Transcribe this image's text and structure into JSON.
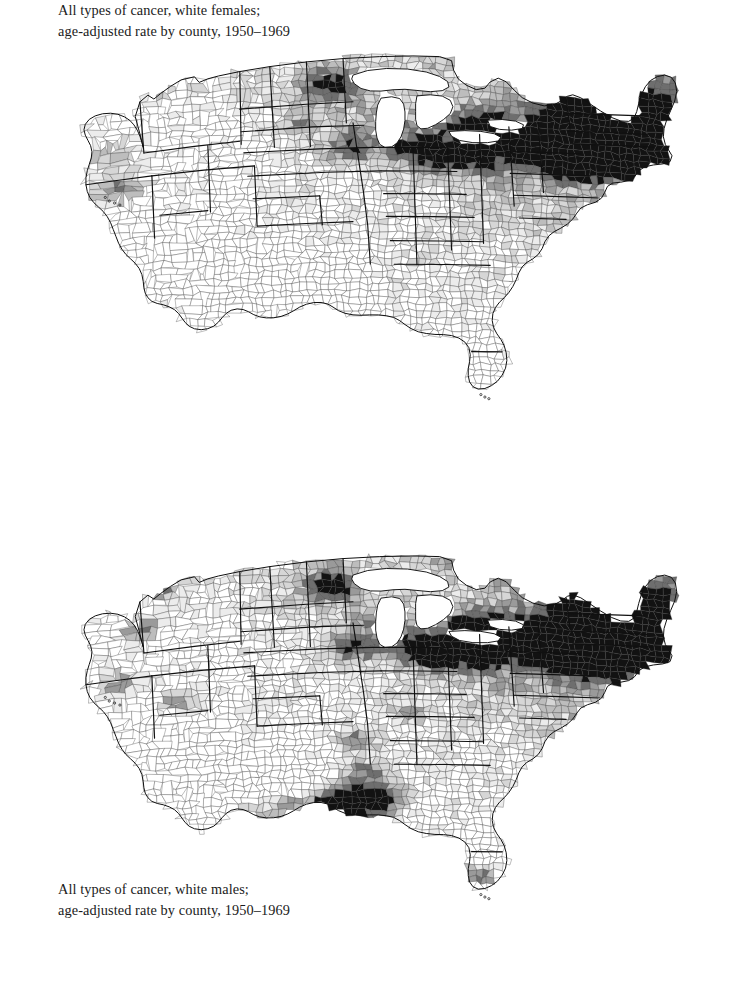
{
  "page": {
    "background": "#ffffff",
    "width": 742,
    "height": 1000
  },
  "palette": {
    "level_0": "#ffffff",
    "level_1": "#ececec",
    "level_2": "#d6d6d6",
    "level_3": "#bdbdbd",
    "level_4": "#9a9a9a",
    "level_5": "#6e6e6e",
    "level_6": "#121212",
    "county_border": "#3a3a3a",
    "state_border": "#101010",
    "text": "#1a1a1a"
  },
  "figures": [
    {
      "id": "figure-white-females",
      "caption_line1": "All types of cancer, white females;",
      "caption_line2": "age-adjusted rate by county, 1950–1969"
    },
    {
      "id": "figure-white-males",
      "caption_line1": "All types of cancer, white males;",
      "caption_line2": "age-adjusted rate by county, 1950–1969"
    }
  ],
  "chart_data": [
    {
      "type": "heatmap",
      "subtype": "choropleth-county-map",
      "title": "All types of cancer, white females; age-adjusted rate by county, 1950–1969",
      "region": "Contiguous United States",
      "unit": "age-adjusted mortality rate per 100,000",
      "period": "1950-1969",
      "population": "white females",
      "legend_shown": false,
      "grid": false,
      "shade_levels": [
        {
          "level": 0,
          "color": "#ffffff",
          "meaning": "lowest rate decile"
        },
        {
          "level": 1,
          "color": "#ececec",
          "meaning": "low"
        },
        {
          "level": 2,
          "color": "#d6d6d6",
          "meaning": "below average"
        },
        {
          "level": 3,
          "color": "#bdbdbd",
          "meaning": "average"
        },
        {
          "level": 4,
          "color": "#9a9a9a",
          "meaning": "above average"
        },
        {
          "level": 5,
          "color": "#6e6e6e",
          "meaning": "high"
        },
        {
          "level": 6,
          "color": "#121212",
          "meaning": "highest rate decile"
        }
      ],
      "regional_summary": [
        {
          "region": "Northeast / New England",
          "dominant_level": 6,
          "note": "dense cluster of highest-rate counties"
        },
        {
          "region": "Mid-Atlantic urban corridor",
          "dominant_level": 6,
          "note": "near-continuous black band"
        },
        {
          "region": "Great Lakes / Upper Midwest",
          "dominant_level": 3,
          "note": "scattered black metro counties"
        },
        {
          "region": "Northern Minnesota",
          "dominant_level": 6,
          "note": "isolated black counties"
        },
        {
          "region": "Great Plains",
          "dominant_level": 2,
          "note": "light to medium"
        },
        {
          "region": "Mountain West",
          "dominant_level": 1,
          "note": "mostly light with medium patches"
        },
        {
          "region": "Southern California",
          "dominant_level": 5,
          "note": "Los Angeles basin dark"
        },
        {
          "region": "Texas",
          "dominant_level": 0,
          "note": "predominantly white, lowest rates"
        },
        {
          "region": "Deep South / Southeast",
          "dominant_level": 0,
          "note": "almost entirely white"
        },
        {
          "region": "Florida",
          "dominant_level": 0,
          "note": "white with isolated medium counties"
        }
      ]
    },
    {
      "type": "heatmap",
      "subtype": "choropleth-county-map",
      "title": "All types of cancer, white males; age-adjusted rate by county, 1950–1969",
      "region": "Contiguous United States",
      "unit": "age-adjusted mortality rate per 100,000",
      "period": "1950-1969",
      "population": "white males",
      "legend_shown": false,
      "grid": false,
      "shade_levels": [
        {
          "level": 0,
          "color": "#ffffff",
          "meaning": "lowest rate decile"
        },
        {
          "level": 1,
          "color": "#ececec",
          "meaning": "low"
        },
        {
          "level": 2,
          "color": "#d6d6d6",
          "meaning": "below average"
        },
        {
          "level": 3,
          "color": "#bdbdbd",
          "meaning": "average"
        },
        {
          "level": 4,
          "color": "#9a9a9a",
          "meaning": "above average"
        },
        {
          "level": 5,
          "color": "#6e6e6e",
          "meaning": "high"
        },
        {
          "level": 6,
          "color": "#121212",
          "meaning": "highest rate decile"
        }
      ],
      "regional_summary": [
        {
          "region": "Northeast / New England",
          "dominant_level": 6,
          "note": "dense cluster of highest-rate counties"
        },
        {
          "region": "Mid-Atlantic urban corridor",
          "dominant_level": 6,
          "note": "near-continuous black band"
        },
        {
          "region": "Great Lakes / Upper Midwest",
          "dominant_level": 3,
          "note": "many black metro counties"
        },
        {
          "region": "Gulf Coast / Louisiana",
          "dominant_level": 6,
          "note": "distinctive coastal black cluster"
        },
        {
          "region": "Lower Mississippi Valley",
          "dominant_level": 5,
          "note": "elevated corridor"
        },
        {
          "region": "Great Plains",
          "dominant_level": 1,
          "note": "light"
        },
        {
          "region": "Mountain West",
          "dominant_level": 1,
          "note": "mostly light, isolated black counties in Nevada"
        },
        {
          "region": "Pacific Northwest",
          "dominant_level": 2,
          "note": "light with black coastal county"
        },
        {
          "region": "Texas",
          "dominant_level": 1,
          "note": "light, darker along Gulf"
        },
        {
          "region": "Florida",
          "dominant_level": 2,
          "note": "medium with black southern tip"
        }
      ]
    }
  ]
}
